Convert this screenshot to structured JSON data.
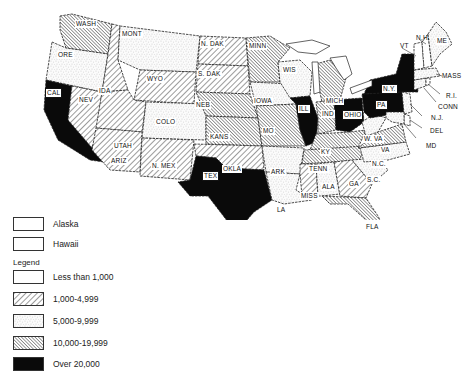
{
  "map": {
    "states": [
      {
        "abbr": "WASH",
        "category": "10,000-19,999"
      },
      {
        "abbr": "ORE",
        "category": "5,000-9,999"
      },
      {
        "abbr": "CAL",
        "category": "Over 20,000"
      },
      {
        "abbr": "IDA",
        "category": "1,000-4,999"
      },
      {
        "abbr": "NEV",
        "category": "1,000-4,999"
      },
      {
        "abbr": "MONT",
        "category": "5,000-9,999"
      },
      {
        "abbr": "WYO",
        "category": "1,000-4,999"
      },
      {
        "abbr": "UTAH",
        "category": "1,000-4,999"
      },
      {
        "abbr": "ARIZ",
        "category": "1,000-4,999"
      },
      {
        "abbr": "COLO",
        "category": "5,000-9,999"
      },
      {
        "abbr": "N. MEX",
        "category": "1,000-4,999"
      },
      {
        "abbr": "N. DAK",
        "category": "1,000-4,999"
      },
      {
        "abbr": "S. DAK",
        "category": "1,000-4,999"
      },
      {
        "abbr": "NEB",
        "category": "10,000-19,999"
      },
      {
        "abbr": "KANS",
        "category": "10,000-19,999"
      },
      {
        "abbr": "OKLA",
        "category": "1,000-4,999"
      },
      {
        "abbr": "TEX",
        "category": "Over 20,000"
      },
      {
        "abbr": "MINN",
        "category": "10,000-19,999"
      },
      {
        "abbr": "IOWA",
        "category": "5,000-9,999"
      },
      {
        "abbr": "MO",
        "category": "10,000-19,999"
      },
      {
        "abbr": "ARK",
        "category": "5,000-9,999"
      },
      {
        "abbr": "LA",
        "category": "5,000-9,999"
      },
      {
        "abbr": "WIS",
        "category": "5,000-9,999"
      },
      {
        "abbr": "ILL",
        "category": "Over 20,000"
      },
      {
        "abbr": "MICH",
        "category": "10,000-19,999"
      },
      {
        "abbr": "IND",
        "category": "10,000-19,999"
      },
      {
        "abbr": "OHIO",
        "category": "Over 20,000"
      },
      {
        "abbr": "KY",
        "category": "10,000-19,999"
      },
      {
        "abbr": "TENN",
        "category": "10,000-19,999"
      },
      {
        "abbr": "MISS",
        "category": "1,000-4,999"
      },
      {
        "abbr": "ALA",
        "category": "5,000-9,999"
      },
      {
        "abbr": "GA",
        "category": "1,000-4,999"
      },
      {
        "abbr": "FLA",
        "category": "10,000-19,999"
      },
      {
        "abbr": "S.C.",
        "category": "5,000-9,999"
      },
      {
        "abbr": "N.C.",
        "category": "5,000-9,999"
      },
      {
        "abbr": "VA",
        "category": "10,000-19,999"
      },
      {
        "abbr": "W. VA",
        "category": "5,000-9,999"
      },
      {
        "abbr": "PA",
        "category": "Over 20,000"
      },
      {
        "abbr": "N.Y.",
        "category": "Over 20,000"
      },
      {
        "abbr": "N.J.",
        "category": "5,000-9,999"
      },
      {
        "abbr": "DEL",
        "category": "Less than 1,000"
      },
      {
        "abbr": "MD",
        "category": "5,000-9,999"
      },
      {
        "abbr": "CONN",
        "category": "5,000-9,999"
      },
      {
        "abbr": "R.I.",
        "category": "Less than 1,000"
      },
      {
        "abbr": "MASS",
        "category": "5,000-9,999"
      },
      {
        "abbr": "VT",
        "category": "Less than 1,000"
      },
      {
        "abbr": "N.H.",
        "category": "Less than 1,000"
      },
      {
        "abbr": "ME",
        "category": "5,000-9,999"
      }
    ],
    "labels": {
      "wash": "WASH",
      "ore": "ORE",
      "cal": "CAL",
      "ida": "IDA",
      "nev": "NEV",
      "mont": "MONT",
      "wyo": "WYO",
      "utah": "UTAH",
      "ariz": "ARIZ",
      "colo": "COLO",
      "nmex": "N. MEX",
      "ndak": "N. DAK",
      "sdak": "S. DAK",
      "neb": "NEB",
      "kans": "KANS",
      "okla": "OKLA",
      "tex": "TEX",
      "minn": "MINN",
      "iowa": "IOWA",
      "mo": "MO",
      "ark": "ARK",
      "la": "LA",
      "wis": "WIS",
      "ill": "ILL",
      "mich": "MICH",
      "ind": "IND",
      "ohio": "OHIO",
      "ky": "KY",
      "tenn": "TENN",
      "miss": "MISS",
      "ala": "ALA",
      "ga": "GA",
      "fla": "FLA",
      "sc": "S.C.",
      "nc": "N.C.",
      "va": "VA",
      "wva": "W. VA",
      "pa": "PA",
      "ny": "N.Y.",
      "nj": "N.J.",
      "del": "DEL",
      "md": "MD",
      "conn": "CONN",
      "ri": "R.I.",
      "mass": "MASS",
      "vt": "VT",
      "nh": "N.H.",
      "me": "ME"
    }
  },
  "insets": [
    {
      "label": "Alaska",
      "category": "Less than 1,000"
    },
    {
      "label": "Hawaii",
      "category": "Less than 1,000"
    }
  ],
  "legend": {
    "title": "Legend",
    "items": [
      {
        "label": "Less than 1,000",
        "pattern": "blank"
      },
      {
        "label": "1,000-4,999",
        "pattern": "wide-diagonal"
      },
      {
        "label": "5,000-9,999",
        "pattern": "stipple"
      },
      {
        "label": "10,000-19,999",
        "pattern": "dense-diagonal"
      },
      {
        "label": "Over 20,000",
        "pattern": "solid-black"
      }
    ]
  },
  "colors": {
    "ink": "#111111",
    "paper": "#ffffff"
  }
}
